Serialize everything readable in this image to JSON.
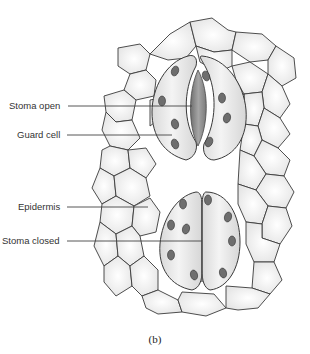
{
  "figure": {
    "caption": "(b)",
    "labels": [
      {
        "id": "stoma-open",
        "text": "Stoma open",
        "x": 9,
        "y": 100,
        "line_to_x": 190,
        "line_y": 106
      },
      {
        "id": "guard-cell",
        "text": "Guard cell",
        "x": 17,
        "y": 129,
        "line_to_x": 172,
        "line_y": 135
      },
      {
        "id": "epidermis",
        "text": "Epidermis",
        "x": 18,
        "y": 201,
        "line_to_x": 148,
        "line_y": 207
      },
      {
        "id": "stoma-closed",
        "text": "Stoma closed",
        "x": 2,
        "y": 236,
        "line_to_x": 202,
        "line_y": 241
      }
    ],
    "structures": [
      "epidermal cells",
      "open stoma with two guard cells",
      "closed stoma with two guard cells",
      "chloroplasts in guard cells"
    ],
    "colors": {
      "cell_outline": "#3a3a3a",
      "cell_fill": "#f2f2f2",
      "guard_cell_fill": "#e6e6e6",
      "pore": "#8c8c8c",
      "chloroplast": "#6e6e6e",
      "label_text": "#333333",
      "leader_line": "#444444"
    }
  }
}
